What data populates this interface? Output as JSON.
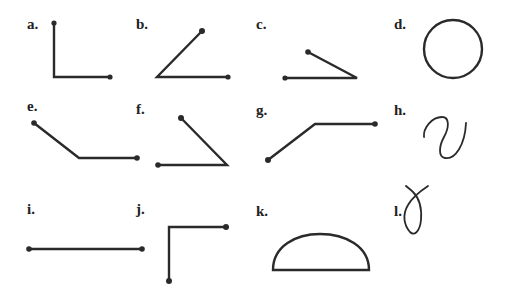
{
  "figure": {
    "panels": [
      {
        "label": "a.",
        "shape": "right-angle-L"
      },
      {
        "label": "b.",
        "shape": "acute-angle-up-right"
      },
      {
        "label": "c.",
        "shape": "narrow-acute-angle"
      },
      {
        "label": "d.",
        "shape": "circle"
      },
      {
        "label": "e.",
        "shape": "obtuse-angle-bent-line"
      },
      {
        "label": "f.",
        "shape": "acute-angle-left-open"
      },
      {
        "label": "g.",
        "shape": "obtuse-angle-bent-line-up"
      },
      {
        "label": "h.",
        "shape": "s-curve"
      },
      {
        "label": "i.",
        "shape": "straight-line"
      },
      {
        "label": "j.",
        "shape": "right-angle-inverted-L"
      },
      {
        "label": "k.",
        "shape": "semicircle"
      },
      {
        "label": "l.",
        "shape": "loop-curve"
      }
    ]
  }
}
